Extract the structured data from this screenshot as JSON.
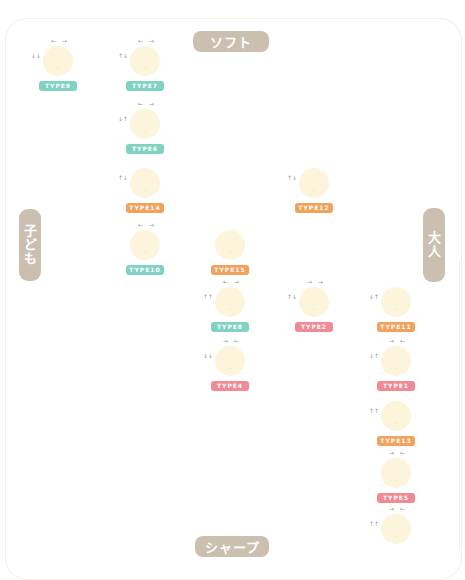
{
  "axes": {
    "top": "ソフト",
    "bottom": "シャープ",
    "left": "子ども",
    "right": "大人"
  },
  "colors": {
    "axis_pill": "#cbbfb0",
    "teal": "#80d3c2",
    "orange": "#f2a25a",
    "pink": "#f08a95",
    "face": "#fcf5dc"
  },
  "nodes": [
    {
      "label": "TYPE9",
      "color": "teal",
      "top_arrows": "← →",
      "left_arrows": "↓↓"
    },
    {
      "label": "TYPE7",
      "color": "teal",
      "top_arrows": "← →",
      "left_arrows": "↑↓"
    },
    {
      "label": "TYPE6",
      "color": "teal",
      "top_arrows": "← →",
      "left_arrows": "↓↑"
    },
    {
      "label": "TYPE14",
      "color": "orange",
      "top_arrows": "",
      "left_arrows": "↑↓"
    },
    {
      "label": "TYPE12",
      "color": "orange",
      "top_arrows": "",
      "left_arrows": "↑↓"
    },
    {
      "label": "TYPE10",
      "color": "teal",
      "top_arrows": "← →",
      "left_arrows": ""
    },
    {
      "label": "TYPE15",
      "color": "orange",
      "top_arrows": "",
      "left_arrows": ""
    },
    {
      "label": "TYPE8",
      "color": "teal",
      "top_arrows": "← →",
      "left_arrows": "↑↑"
    },
    {
      "label": "TYPE2",
      "color": "pink",
      "top_arrows": "→ →",
      "left_arrows": "↑↓"
    },
    {
      "label": "TYPE11",
      "color": "orange",
      "top_arrows": "",
      "left_arrows": "↓↑"
    },
    {
      "label": "TYPE4",
      "color": "pink",
      "top_arrows": "→ ←",
      "left_arrows": "↓↓"
    },
    {
      "label": "TYPE1",
      "color": "pink",
      "top_arrows": "→ ←",
      "left_arrows": "↓↑"
    },
    {
      "label": "TYPE13",
      "color": "orange",
      "top_arrows": "",
      "left_arrows": "↑↑"
    },
    {
      "label": "TYPE5",
      "color": "pink",
      "top_arrows": "→ ←",
      "left_arrows": ""
    },
    {
      "label": "TYPE3",
      "color": "pink",
      "top_arrows": "→ ←",
      "left_arrows": "↑↑"
    }
  ]
}
